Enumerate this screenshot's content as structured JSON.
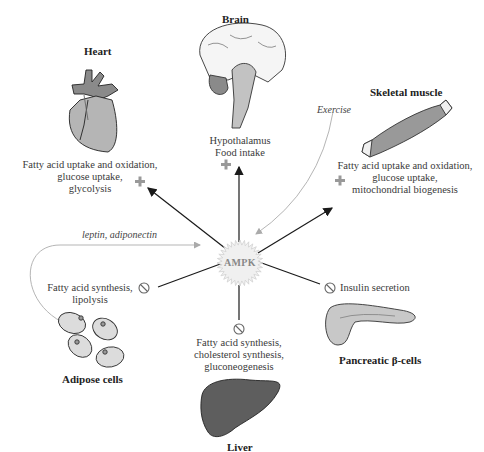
{
  "diagram": {
    "center": {
      "label": "AMPK"
    },
    "organs": {
      "heart": {
        "title": "Heart",
        "effect_lines": [
          "Fatty acid uptake and oxidation,",
          "glucose uptake,",
          "glycolysis"
        ],
        "effect_sign": "+"
      },
      "brain": {
        "title": "Brain",
        "effect_lines": [
          "Hypothalamus",
          "Food intake"
        ],
        "effect_sign": "+"
      },
      "skeletal_muscle": {
        "title": "Skeletal muscle",
        "effect_lines": [
          "Fatty acid uptake and oxidation,",
          "glucose uptake,",
          "mitochondrial biogenesis"
        ],
        "effect_sign": "+",
        "input_label": "Exercise"
      },
      "adipose": {
        "title": "Adipose cells",
        "effect_lines": [
          "Fatty acid synthesis,",
          "lipolysis"
        ],
        "effect_sign": "inhibit",
        "input_label": "leptin, adiponectin"
      },
      "liver": {
        "title": "Liver",
        "effect_lines": [
          "Fatty acid synthesis,",
          "cholesterol synthesis,",
          "gluconeogenesis"
        ],
        "effect_sign": "inhibit"
      },
      "pancreas": {
        "title": "Pancreatic β-cells",
        "effect_lines": [
          "Insulin secretion"
        ],
        "effect_sign": "inhibit"
      }
    },
    "colors": {
      "arrow": "#1a1a1a",
      "input_arrow": "#b0b0b0",
      "organ_fill": "#a8a8a8",
      "organ_dark": "#6e6e6e",
      "text": "#3a3a3a"
    }
  }
}
